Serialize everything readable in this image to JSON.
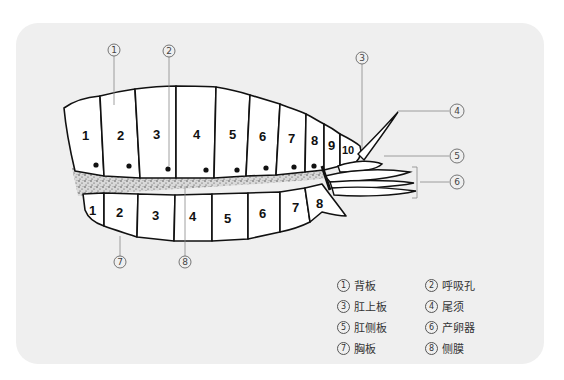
{
  "diagram": {
    "dorsal_segments": [
      "1",
      "2",
      "3",
      "4",
      "5",
      "6",
      "7",
      "8",
      "9",
      "10"
    ],
    "ventral_segments": [
      "1",
      "2",
      "3",
      "4",
      "5",
      "6",
      "7",
      "8"
    ],
    "callouts": [
      {
        "id": "1",
        "symbol": "①"
      },
      {
        "id": "2",
        "symbol": "②"
      },
      {
        "id": "3",
        "symbol": "③"
      },
      {
        "id": "4",
        "symbol": "④"
      },
      {
        "id": "5",
        "symbol": "⑤"
      },
      {
        "id": "6",
        "symbol": "⑥"
      },
      {
        "id": "7",
        "symbol": "⑦"
      },
      {
        "id": "8",
        "symbol": "⑧"
      }
    ]
  },
  "legend": {
    "items": [
      {
        "num": "1",
        "label": "背板"
      },
      {
        "num": "2",
        "label": "呼吸孔"
      },
      {
        "num": "3",
        "label": "肛上板"
      },
      {
        "num": "4",
        "label": "尾须"
      },
      {
        "num": "5",
        "label": "肛侧板"
      },
      {
        "num": "6",
        "label": "产卵器"
      },
      {
        "num": "7",
        "label": "胸板"
      },
      {
        "num": "8",
        "label": "侧膜"
      }
    ]
  },
  "colors": {
    "panel": "#efefef",
    "outline": "#111111",
    "plate_fill": "#ffffff",
    "leader_line": "#888888"
  }
}
